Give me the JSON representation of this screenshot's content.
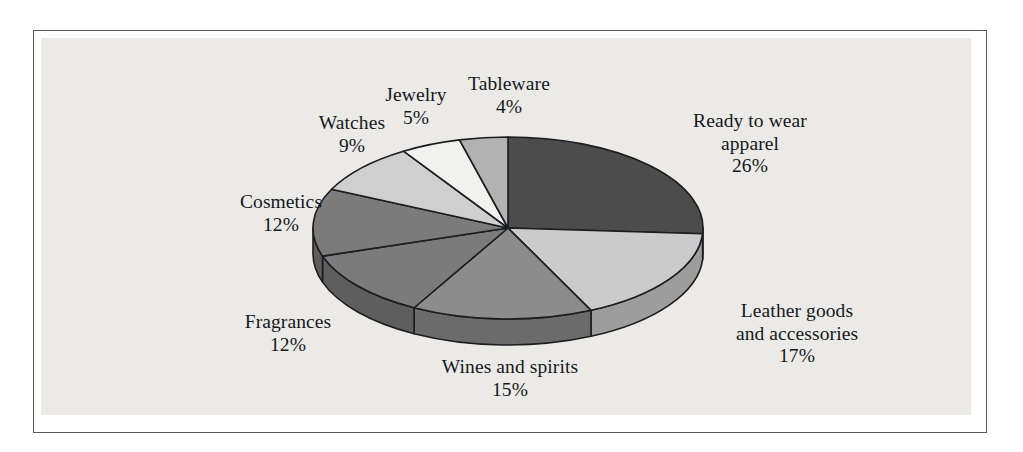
{
  "figure": {
    "background_color": "#ffffff",
    "plate_color": "#eceae7",
    "frame_color": "#55585c",
    "text_color": "#15181c"
  },
  "chart_data": {
    "type": "pie",
    "title": "",
    "subtitle": "",
    "xlabel": "",
    "ylabel": "",
    "legend_position": "none",
    "grid": false,
    "three_d": true,
    "start_angle_deg": 0,
    "direction": "clockwise",
    "units": "percent",
    "total": 100,
    "categories": [
      "Ready to wear apparel",
      "Leather goods and accessories",
      "Wines and spirits",
      "Fragrances",
      "Cosmetics",
      "Watches",
      "Jewelry",
      "Tableware"
    ],
    "values": [
      26,
      17,
      15,
      12,
      12,
      9,
      5,
      4
    ],
    "slices": [
      {
        "label": "Ready to wear\napparel",
        "label_line1": "Ready to wear",
        "label_line2": "apparel",
        "value": 26,
        "percent_text": "26%",
        "color": "#4c4c4c",
        "side_color": "#3a3a3a"
      },
      {
        "label": "Leather goods\nand accessories",
        "label_line1": "Leather goods",
        "label_line2": "and accessories",
        "value": 17,
        "percent_text": "17%",
        "color": "#cbcbcb",
        "side_color": "#9d9d9d"
      },
      {
        "label": "Wines and spirits",
        "label_line1": "Wines and spirits",
        "label_line2": "",
        "value": 15,
        "percent_text": "15%",
        "color": "#8c8c8c",
        "side_color": "#6b6b6b"
      },
      {
        "label": "Fragrances",
        "label_line1": "Fragrances",
        "label_line2": "",
        "value": 12,
        "percent_text": "12%",
        "color": "#7b7b7b",
        "side_color": "#5e5e5e"
      },
      {
        "label": "Cosmetics",
        "label_line1": "Cosmetics",
        "label_line2": "",
        "value": 12,
        "percent_text": "12%",
        "color": "#7b7b7b",
        "side_color": "#5e5e5e"
      },
      {
        "label": "Watches",
        "label_line1": "Watches",
        "label_line2": "",
        "value": 9,
        "percent_text": "9%",
        "color": "#cfcfcf",
        "side_color": "#a2a2a2"
      },
      {
        "label": "Jewelry",
        "label_line1": "Jewelry",
        "label_line2": "",
        "value": 5,
        "percent_text": "5%",
        "color": "#f1f1ef",
        "side_color": "#bdbdbd"
      },
      {
        "label": "Tableware",
        "label_line1": "Tableware",
        "label_line2": "",
        "value": 4,
        "percent_text": "4%",
        "color": "#b2b2b2",
        "side_color": "#8a8a8a"
      }
    ]
  },
  "geometry": {
    "cx": 508,
    "cy": 228,
    "rx": 195,
    "ry": 91,
    "depth": 26,
    "stroke_color": "#1b1d20",
    "stroke_width": 1.6
  },
  "labels": [
    {
      "name": "ready-to-wear-apparel",
      "line1": "Ready to wear",
      "line2": "apparel",
      "pct": "26%",
      "left": 640,
      "top": 110,
      "width": 220
    },
    {
      "name": "leather-goods-and-accessories",
      "line1": "Leather goods",
      "line2": "and accessories",
      "pct": "17%",
      "left": 672,
      "top": 300,
      "width": 250
    },
    {
      "name": "wines-and-spirits",
      "line1": "Wines and spirits",
      "line2": "",
      "pct": "15%",
      "left": 400,
      "top": 356,
      "width": 220
    },
    {
      "name": "fragrances",
      "line1": "Fragrances",
      "line2": "",
      "pct": "12%",
      "left": 193,
      "top": 311,
      "width": 190
    },
    {
      "name": "cosmetics",
      "line1": "Cosmetics",
      "line2": "",
      "pct": "12%",
      "left": 186,
      "top": 191,
      "width": 190
    },
    {
      "name": "watches",
      "line1": "Watches",
      "line2": "",
      "pct": "9%",
      "left": 272,
      "top": 112,
      "width": 160
    },
    {
      "name": "jewelry",
      "line1": "Jewelry",
      "line2": "",
      "pct": "5%",
      "left": 341,
      "top": 84,
      "width": 150
    },
    {
      "name": "tableware",
      "line1": "Tableware",
      "line2": "",
      "pct": "4%",
      "left": 429,
      "top": 73,
      "width": 160
    }
  ]
}
